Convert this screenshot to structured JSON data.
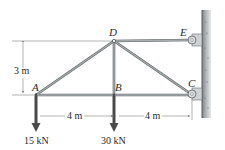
{
  "diagram": {
    "type": "truss",
    "joints": {
      "A": {
        "label": "A"
      },
      "B": {
        "label": "B"
      },
      "C": {
        "label": "C"
      },
      "D": {
        "label": "D"
      },
      "E": {
        "label": "E"
      }
    },
    "members": [
      "AB",
      "BC",
      "AD",
      "BD",
      "CD",
      "DE"
    ],
    "supports": [
      {
        "joint": "E",
        "type": "pin-to-wall"
      },
      {
        "joint": "C",
        "type": "pin-to-wall"
      }
    ],
    "dimensions": {
      "height": "3 m",
      "span_left": "4 m",
      "span_right": "4 m"
    },
    "loads": [
      {
        "joint": "A",
        "label": "15 kN",
        "direction": "down"
      },
      {
        "joint": "B",
        "label": "30 kN",
        "direction": "down"
      }
    ],
    "colors": {
      "member": "#8f9597",
      "member_edge": "#5e6466",
      "load_arrow": "#4a4a4a",
      "wall": "#9a9fa1",
      "bracket": "#c9ccce",
      "dim_line": "#555555"
    }
  }
}
